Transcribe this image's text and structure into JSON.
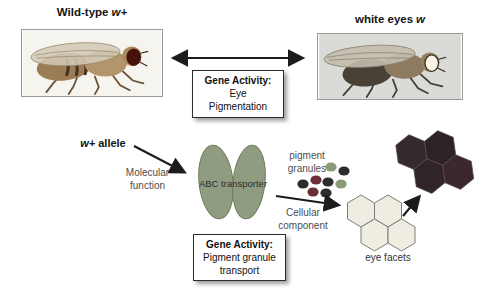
{
  "labels": {
    "wildtype": {
      "name": "Wild-type",
      "allele": "w+"
    },
    "white_eyes": {
      "name": "white eyes",
      "allele": "w"
    },
    "allele": {
      "gene": "w+",
      "word": "allele"
    },
    "molecular_function": {
      "line1": "Molecular",
      "line2": "function"
    },
    "abc_transporter": "ABC transporter",
    "pigment_granules": {
      "line1": "pigment",
      "line2": "granules"
    },
    "cellular_component": {
      "line1": "Cellular",
      "line2": "component"
    },
    "eye_facets": "eye facets"
  },
  "boxes": {
    "eye_pigmentation": {
      "title": "Gene Activity:",
      "line1": "Eye",
      "line2": "Pigmentation"
    },
    "granule_transport": {
      "title": "Gene Activity:",
      "line1": "Pigment granule",
      "line2": "transport"
    }
  },
  "colors": {
    "transporter_fill": "#8f9c80",
    "transporter_stroke": "#6e7d5c",
    "granule_dark": "#2e2b2c",
    "granule_maroon": "#6b2d38",
    "granule_olive": "#8a9a74",
    "facet_light_fill": "#efede1",
    "facet_light_stroke": "#7c7c7a",
    "facet_dark_1": "#352a2e",
    "facet_dark_2": "#2b2327",
    "facet_dark_3": "#2f2429",
    "facet_dark_4": "#3c2730",
    "arrow": "#1c1c1c",
    "wildtype_eye": "#451309",
    "white_eye": "#f8f4e6"
  }
}
